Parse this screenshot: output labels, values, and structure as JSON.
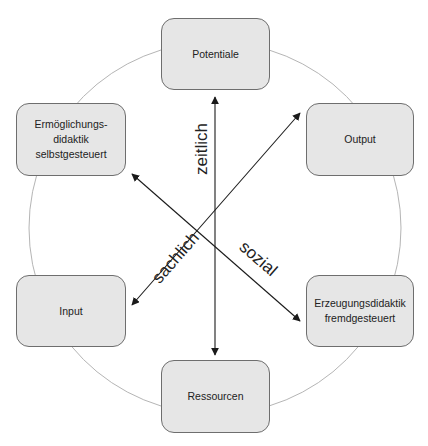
{
  "diagram": {
    "center": {
      "x": 215,
      "y": 228
    },
    "circle_radius": 186,
    "colors": {
      "node_fill": "#e6e6e6",
      "node_border": "#6e6e6e",
      "circle": "#b5b5b5",
      "arrow": "#1a1a1a",
      "text": "#222222"
    },
    "nodes": [
      {
        "id": "potentiale",
        "label": "Potentiale",
        "x": 161,
        "y": 18,
        "w": 109,
        "h": 72
      },
      {
        "id": "ermoeglichungsdidaktik",
        "label": "Ermöglichungs-\ndidaktik\nselbstgesteuert",
        "x": 16,
        "y": 103,
        "w": 110,
        "h": 73
      },
      {
        "id": "output",
        "label": "Output",
        "x": 306,
        "y": 103,
        "w": 108,
        "h": 73
      },
      {
        "id": "input",
        "label": "Input",
        "x": 16,
        "y": 275,
        "w": 110,
        "h": 72
      },
      {
        "id": "erzeugungsdidaktik",
        "label": "Erzeugungsdidaktik\nfremdgesteuert",
        "x": 306,
        "y": 275,
        "w": 108,
        "h": 72
      },
      {
        "id": "ressourcen",
        "label": "Ressourcen",
        "x": 161,
        "y": 360,
        "w": 109,
        "h": 73
      }
    ],
    "axes": [
      {
        "id": "zeitlich",
        "label": "zeitlich",
        "from": [
          215,
          355
        ],
        "to": [
          215,
          97
        ],
        "double_headed": true
      },
      {
        "id": "sozial",
        "label": "sozial",
        "from": [
          132,
          174
        ],
        "to": [
          300,
          321
        ],
        "double_headed": true
      },
      {
        "id": "sachlich",
        "label": "sachlich",
        "from": [
          300,
          113
        ],
        "to": [
          132,
          305
        ],
        "double_headed": true
      }
    ],
    "axis_labels": {
      "zeitlich": "zeitlich",
      "sachlich": "sachlich",
      "sozial": "sozial"
    }
  }
}
